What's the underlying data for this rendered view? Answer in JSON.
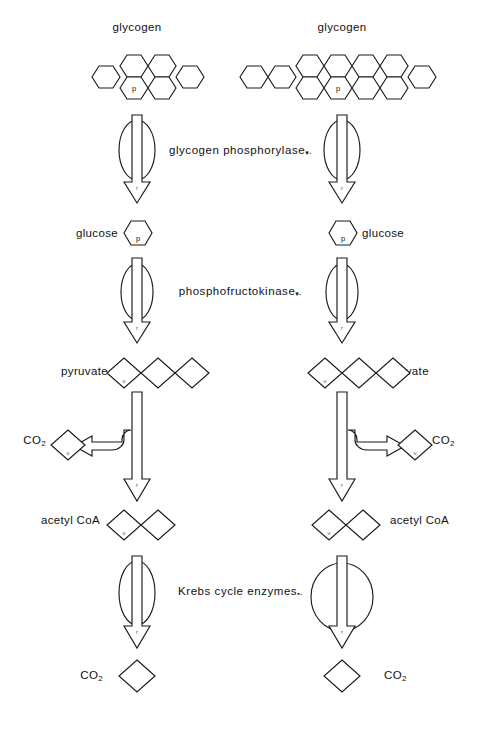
{
  "figure": {
    "type": "biochemical-pathway-diagram",
    "columns": [
      {
        "id": "left",
        "center_x": 137,
        "glycogen_units": 6,
        "krebs_enzyme_size": "small"
      },
      {
        "id": "right",
        "center_x": 342,
        "glycogen_units": 11,
        "krebs_enzyme_size": "large"
      }
    ]
  },
  "left": {
    "glycogen_label": "glycogen",
    "glucose_label": "glucose",
    "pyruvate_label": "pyruvate",
    "acetyl_coa_label": "acetyl CoA",
    "co2_mid_label": "CO",
    "co2_mid_sub": "2",
    "co2_bottom_label": "CO",
    "co2_bottom_sub": "2",
    "phosphate_mark": "p",
    "glycogen_units": 6,
    "glucose_units": 1,
    "pyruvate_units": 3,
    "acetyl_coa_units": 2,
    "co2_mid_units": 1,
    "co2_bottom_units": 1
  },
  "right": {
    "glycogen_label": "glycogen",
    "glucose_label": "glucose",
    "pyruvate_label": "pyruvate",
    "acetyl_coa_label": "acetyl CoA",
    "co2_mid_label": "CO",
    "co2_mid_sub": "2",
    "co2_bottom_label": "CO",
    "co2_bottom_sub": "2",
    "phosphate_mark": "p",
    "glycogen_units": 11,
    "glucose_units": 1,
    "pyruvate_units": 3,
    "acetyl_coa_units": 2,
    "co2_mid_units": 1,
    "co2_bottom_units": 1
  },
  "enzymes": {
    "step1": "glycogen phosphorylase",
    "step1_mark": "▾-",
    "step2": "phosphofructokinase",
    "step2_mark": "▾-",
    "step4": "Krebs cycle enzymes",
    "step4_mark": "▪-"
  },
  "colors": {
    "ink": "#1a1a1a",
    "background": "#ffffff",
    "text": "#111111"
  }
}
